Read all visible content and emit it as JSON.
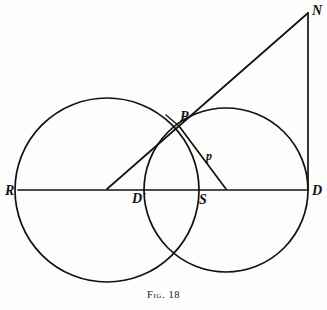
{
  "figure": {
    "caption": "Fig. 18",
    "background_color": "#fdfdfc",
    "ink_color": "#111111",
    "width": 327,
    "height": 310
  },
  "labels": {
    "R": "R",
    "D_prime": "D'",
    "S": "S",
    "D": "D",
    "P": "P",
    "p": "p",
    "N": "N"
  },
  "chart_data": {
    "type": "diagram",
    "title": "Fig. 18",
    "points": [
      {
        "name": "R",
        "x": 18,
        "y": 190,
        "label": "R",
        "label_x": 5,
        "label_y": 184
      },
      {
        "name": "D_prime",
        "x": 150,
        "y": 190,
        "label": "D'",
        "label_x": 132,
        "label_y": 192
      },
      {
        "name": "S",
        "x": 203,
        "y": 190,
        "label": "S",
        "label_x": 199,
        "label_y": 193
      },
      {
        "name": "D",
        "x": 308,
        "y": 190,
        "label": "D",
        "label_x": 312,
        "label_y": 184
      },
      {
        "name": "P",
        "x": 179,
        "y": 126,
        "label": "P",
        "label_x": 180,
        "label_y": 110
      },
      {
        "name": "N",
        "x": 308,
        "y": 13,
        "label": "N",
        "label_x": 312,
        "label_y": 4
      },
      {
        "name": "p",
        "x": 210,
        "y": 155,
        "label": "p",
        "label_x": 206,
        "label_y": 150
      },
      {
        "name": "C1",
        "x": 107,
        "y": 190,
        "label": "",
        "label_x": 0,
        "label_y": 0
      },
      {
        "name": "C2",
        "x": 226,
        "y": 190,
        "label": "",
        "label_x": 0,
        "label_y": 0
      }
    ],
    "circles": [
      {
        "name": "left-circle",
        "cx": 107,
        "cy": 190,
        "r": 92
      },
      {
        "name": "right-circle",
        "cx": 226,
        "cy": 190,
        "r": 82
      }
    ],
    "segments": [
      {
        "name": "axis-R-D",
        "x1": 18,
        "y1": 190,
        "x2": 308,
        "y2": 190
      },
      {
        "name": "vertical-N-D",
        "x1": 308,
        "y1": 13,
        "x2": 308,
        "y2": 190
      },
      {
        "name": "line-N-P",
        "x1": 308,
        "y1": 13,
        "x2": 179,
        "y2": 126
      },
      {
        "name": "tick-P-extended",
        "x1": 179,
        "y1": 126,
        "x2": 166,
        "y2": 115
      },
      {
        "name": "line-P-leftcenter",
        "x1": 179,
        "y1": 126,
        "x2": 107,
        "y2": 189
      },
      {
        "name": "line-P-rightcenter",
        "x1": 179,
        "y1": 126,
        "x2": 226,
        "y2": 189
      }
    ],
    "axis_range_x": [
      0,
      327
    ],
    "axis_range_y": [
      0,
      310
    ],
    "grid": false,
    "legend": "none"
  }
}
